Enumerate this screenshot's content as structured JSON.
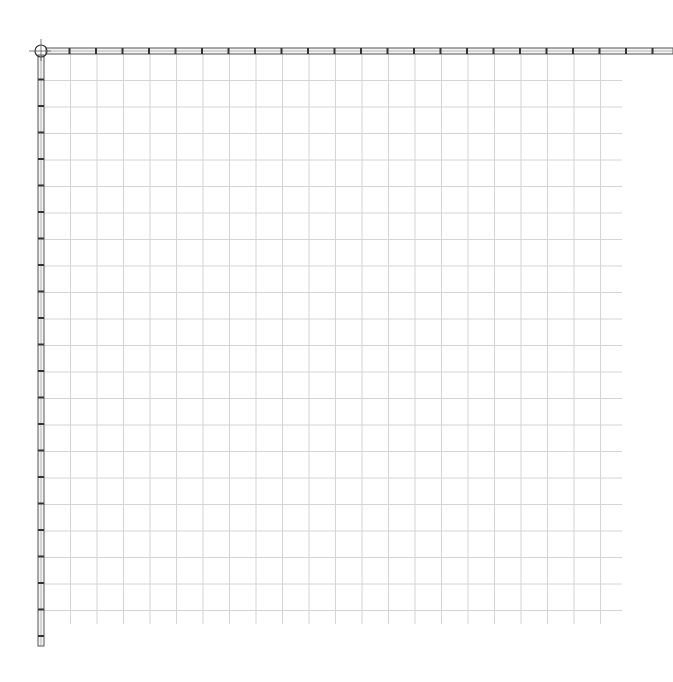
{
  "canvas": {
    "background": "#ffffff",
    "grid": {
      "origin_x": 44,
      "origin_y": 54,
      "spacing": 26.5,
      "cols": 22,
      "rows": 21,
      "end_x": 622,
      "end_y": 612,
      "color": "#d4d4d4"
    },
    "top_ruler": {
      "y": 51,
      "x_start": 36,
      "x_end": 673,
      "tick_spacing": 26.5,
      "color": "#555555"
    },
    "left_ruler": {
      "x": 41,
      "y_start": 45,
      "y_end": 646,
      "tick_spacing": 26.5,
      "color": "#555555"
    },
    "origin_marker": {
      "x": 41,
      "y": 51,
      "r": 6
    }
  }
}
